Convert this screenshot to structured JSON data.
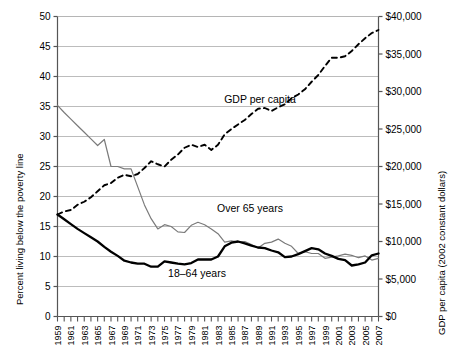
{
  "chart_data": {
    "type": "line",
    "title": "",
    "xlabel": "",
    "ylabel": "Percent living below the poverty line",
    "y2label": "GDP per capita (2002 constant dollars)",
    "grid": true,
    "legend_position": "inline-annotations",
    "xlim": [
      1959,
      2007
    ],
    "ylim": [
      0,
      50
    ],
    "y2lim": [
      0,
      40000
    ],
    "x_tick_labels": [
      "1959",
      "1961",
      "1963",
      "1965",
      "1967",
      "1969",
      "1971",
      "1973",
      "1975",
      "1977",
      "1979",
      "1981",
      "1983",
      "1985",
      "1987",
      "1989",
      "1991",
      "1993",
      "1995",
      "1997",
      "1999",
      "2001",
      "2003",
      "2005",
      "2007"
    ],
    "y_tick_labels": [
      "0",
      "5",
      "10",
      "15",
      "20",
      "25",
      "30",
      "35",
      "40",
      "45",
      "50"
    ],
    "y2_tick_labels": [
      "$0",
      "$5,000",
      "$10,000",
      "$15,000",
      "$20,000",
      "$25,000",
      "$30,000",
      "$35,000",
      "$40,000"
    ],
    "x": [
      1959,
      1960,
      1961,
      1962,
      1963,
      1964,
      1965,
      1966,
      1967,
      1968,
      1969,
      1970,
      1971,
      1972,
      1973,
      1974,
      1975,
      1976,
      1977,
      1978,
      1979,
      1980,
      1981,
      1982,
      1983,
      1984,
      1985,
      1986,
      1987,
      1988,
      1989,
      1990,
      1991,
      1992,
      1993,
      1994,
      1995,
      1996,
      1997,
      1998,
      1999,
      2000,
      2001,
      2002,
      2003,
      2004,
      2005,
      2006,
      2007
    ],
    "series": [
      {
        "name": "Over 65 years",
        "axis": "left",
        "style": "solid-thin-gray",
        "color": "#7a7a7a",
        "values": [
          35.2,
          34.0,
          32.9,
          31.8,
          30.7,
          29.6,
          28.5,
          29.5,
          25.0,
          25.0,
          24.6,
          24.6,
          21.6,
          18.6,
          16.3,
          14.6,
          15.3,
          15.0,
          14.1,
          14.0,
          15.2,
          15.7,
          15.3,
          14.6,
          13.8,
          12.4,
          12.6,
          12.4,
          12.5,
          12.0,
          11.4,
          12.2,
          12.4,
          12.9,
          12.2,
          11.7,
          10.5,
          10.8,
          10.5,
          10.5,
          9.7,
          9.9,
          10.1,
          10.4,
          10.2,
          9.8,
          10.1,
          9.4,
          9.7
        ]
      },
      {
        "name": "18–64 years",
        "axis": "left",
        "style": "solid-thick-black",
        "color": "#000000",
        "values": [
          17.0,
          16.2,
          15.4,
          14.6,
          13.9,
          13.2,
          12.5,
          11.6,
          10.8,
          10.1,
          9.3,
          9.0,
          8.8,
          8.8,
          8.3,
          8.3,
          9.2,
          9.0,
          8.8,
          8.7,
          8.9,
          9.5,
          9.5,
          9.5,
          10.0,
          11.7,
          12.3,
          12.5,
          12.2,
          11.8,
          11.5,
          11.4,
          11.0,
          10.7,
          9.9,
          10.0,
          10.4,
          10.9,
          11.4,
          11.2,
          10.5,
          10.1,
          9.6,
          9.4,
          8.5,
          8.7,
          9.0,
          10.2,
          10.5
        ]
      },
      {
        "name": "GDP per capita",
        "axis": "right",
        "style": "dashed-black",
        "color": "#000000",
        "values": [
          13600,
          14000,
          14200,
          14900,
          15300,
          15900,
          16700,
          17500,
          17800,
          18500,
          18900,
          18700,
          19000,
          19800,
          20700,
          20300,
          20000,
          20900,
          21600,
          22500,
          22900,
          22600,
          22900,
          22200,
          22900,
          24300,
          25000,
          25600,
          26200,
          27000,
          27700,
          27800,
          27400,
          27900,
          28300,
          29100,
          29600,
          30300,
          31300,
          32200,
          33400,
          34500,
          34500,
          34700,
          35400,
          36300,
          37100,
          37800,
          38200
        ]
      }
    ],
    "annotations": [
      {
        "text": "GDP per capita",
        "series": "GDP per capita"
      },
      {
        "text": "Over 65 years",
        "series": "Over 65 years"
      },
      {
        "text": "18–64 years",
        "series": "18–64 years"
      }
    ]
  }
}
